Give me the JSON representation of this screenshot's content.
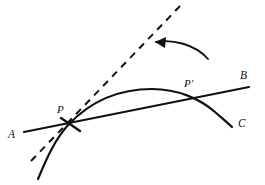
{
  "figure": {
    "background_color": "#ffffff",
    "ink_color": "#111111",
    "width": 265,
    "height": 185
  },
  "labels": {
    "point_p": "P",
    "point_p_prime": "P'",
    "line_start_a": "A",
    "line_end_b": "B",
    "curve_end_c": "C"
  },
  "elements": {
    "secant_line": {
      "name": "line-AB",
      "style": "solid",
      "from_label": "A",
      "to_label": "B",
      "x1": 24,
      "y1": 132,
      "x2": 249,
      "y2": 87,
      "stroke_width": 2.1
    },
    "curve": {
      "name": "curve-C",
      "style": "solid",
      "end_label": "C",
      "path": "M 38,179 C 48,155 56,138 69,124 C 95,97 126,89 152,89 C 178,89 200,99 215,112 C 223,119 228,123 232,127",
      "stroke_width": 2.2
    },
    "tangent_line": {
      "name": "tangent-at-P",
      "style": "dashed",
      "x1": 31,
      "y1": 161,
      "x2": 181,
      "y2": 5,
      "stroke_width": 2.0,
      "dash_pattern": "7 6"
    },
    "tick_mark": {
      "name": "tick-mark-at-P",
      "x1": 61,
      "y1": 118,
      "x2": 80,
      "y2": 131,
      "stroke_width": 2.4
    },
    "rotation_arrow": {
      "name": "rotation-arrow",
      "path": "M 208,59 C 195,44 172,39 156,42",
      "stroke_width": 1.9,
      "head_points": "155,42 166,37 165,48",
      "direction": "right-to-left"
    }
  },
  "label_positions": {
    "point_p": {
      "x": 57,
      "y": 113
    },
    "point_p_prime": {
      "x": 184,
      "y": 87
    },
    "line_start_a": {
      "x": 8,
      "y": 138
    },
    "line_end_b": {
      "x": 240,
      "y": 79
    },
    "curve_end_c": {
      "x": 238,
      "y": 127
    }
  }
}
